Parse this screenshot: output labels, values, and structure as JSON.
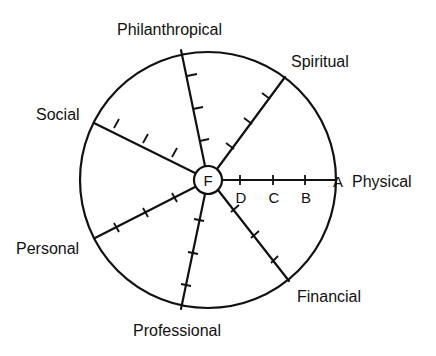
{
  "diagram": {
    "center_label": "F",
    "spokes": [
      {
        "label": "Philanthropical",
        "angle": -102
      },
      {
        "label": "Spiritual",
        "angle": -53
      },
      {
        "label": "Physical",
        "angle": 0
      },
      {
        "label": "Financial",
        "angle": 50
      },
      {
        "label": "Professional",
        "angle": 100
      },
      {
        "label": "Personal",
        "angle": 152
      },
      {
        "label": "Social",
        "angle": -153
      }
    ],
    "scale_markers": [
      "A",
      "B",
      "C",
      "D"
    ],
    "colors": {
      "line": "#111111",
      "background": "#ffffff"
    }
  }
}
